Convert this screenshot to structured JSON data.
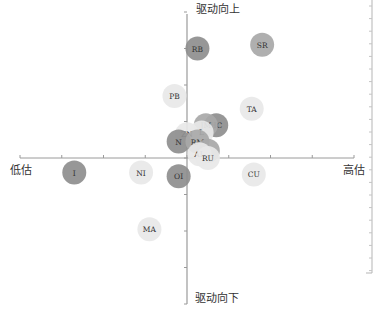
{
  "chart_data": {
    "type": "scatter",
    "subtype": "bubble-quadrant",
    "title": "",
    "axis_labels": {
      "top": "驱动向上",
      "bottom": "驱动向下",
      "left": "低估",
      "right": "高估"
    },
    "xlim": [
      -4,
      4
    ],
    "ylim": [
      -4,
      4
    ],
    "grid": false,
    "legend": null,
    "colors": {
      "dark": "#8e8e8e",
      "medium": "#a8a8a8",
      "light": "#e8e8e8",
      "axis": "#9a9a9a",
      "text": "#333333"
    },
    "points": [
      {
        "label": "RB",
        "x": 0.25,
        "y": 3.0,
        "shade": "dark"
      },
      {
        "label": "SR",
        "x": 1.8,
        "y": 3.1,
        "shade": "medium"
      },
      {
        "label": "PB",
        "x": -0.3,
        "y": 1.7,
        "shade": "light"
      },
      {
        "label": "TA",
        "x": 1.55,
        "y": 1.35,
        "shade": "light"
      },
      {
        "label": "HC",
        "x": 0.7,
        "y": 0.9,
        "shade": "dark"
      },
      {
        "label": "JM",
        "x": 0.45,
        "y": 0.9,
        "shade": "medium"
      },
      {
        "label": "L",
        "x": 0.35,
        "y": 0.7,
        "shade": "light"
      },
      {
        "label": "ZN",
        "x": 0.0,
        "y": 0.65,
        "shade": "light"
      },
      {
        "label": "N",
        "x": -0.2,
        "y": 0.45,
        "shade": "dark"
      },
      {
        "label": "RM",
        "x": 0.25,
        "y": 0.45,
        "shade": "medium"
      },
      {
        "label": "J",
        "x": 0.5,
        "y": 0.2,
        "shade": "medium"
      },
      {
        "label": "AL",
        "x": 0.3,
        "y": 0.1,
        "shade": "light"
      },
      {
        "label": "RU",
        "x": 0.5,
        "y": 0.0,
        "shade": "light"
      },
      {
        "label": "I",
        "x": -2.7,
        "y": -0.4,
        "shade": "dark"
      },
      {
        "label": "NI",
        "x": -1.1,
        "y": -0.4,
        "shade": "light"
      },
      {
        "label": "OI",
        "x": -0.2,
        "y": -0.5,
        "shade": "dark"
      },
      {
        "label": "CU",
        "x": 1.6,
        "y": -0.45,
        "shade": "light"
      },
      {
        "label": "MA",
        "x": -0.9,
        "y": -1.95,
        "shade": "light"
      }
    ]
  }
}
